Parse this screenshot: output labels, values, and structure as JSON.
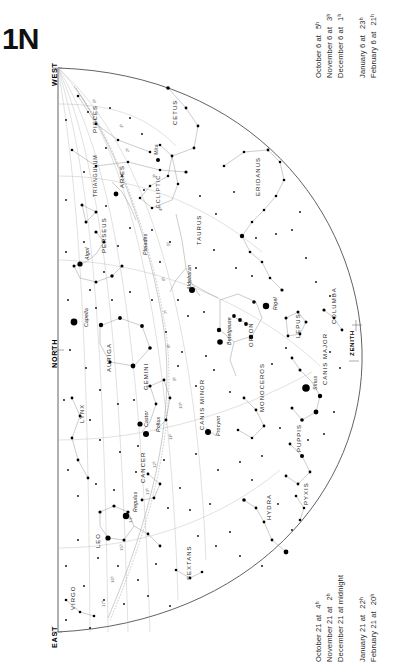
{
  "chart": {
    "number": "1N",
    "title_label": "1N",
    "cardinals": {
      "west": "WEST",
      "north": "NORTH",
      "east": "EAST"
    },
    "zenith_label": "ZENITH",
    "ecliptic_label": "ECLIPTIC"
  },
  "dates_top": {
    "heading": "",
    "rows": [
      {
        "date": "October 6 at",
        "time": "5ʰ"
      },
      {
        "date": "November 6 at",
        "time": "3ʰ"
      },
      {
        "date": "December 6 at",
        "time": "1ʰ"
      },
      {
        "date": "January 6 at",
        "time": "23ʰ"
      },
      {
        "date": "February 6 at",
        "time": "21ʰ"
      }
    ]
  },
  "dates_bottom": {
    "rows": [
      {
        "date": "October 21 at",
        "time": "4ʰ"
      },
      {
        "date": "November 21 at",
        "time": "2ʰ"
      },
      {
        "date": "December 21 at midnight",
        "time": ""
      },
      {
        "date": "January 21 at",
        "time": "22ʰ"
      },
      {
        "date": "February 21 at",
        "time": "20ʰ"
      }
    ]
  },
  "constellations": [
    {
      "name": "PISCES",
      "x": 92,
      "y": 133,
      "size": "normal"
    },
    {
      "name": "CETUS",
      "x": 172,
      "y": 125,
      "size": "normal"
    },
    {
      "name": "TRIANGULUM",
      "x": 92,
      "y": 197,
      "size": "small"
    },
    {
      "name": "ARIES",
      "x": 119,
      "y": 188,
      "size": "normal"
    },
    {
      "name": "ERIDANUS",
      "x": 255,
      "y": 196,
      "size": "normal"
    },
    {
      "name": "PERSEUS",
      "x": 101,
      "y": 253,
      "size": "normal"
    },
    {
      "name": "TAURUS",
      "x": 196,
      "y": 245,
      "size": "normal"
    },
    {
      "name": "AURIGA",
      "x": 106,
      "y": 372,
      "size": "normal"
    },
    {
      "name": "GEMINI",
      "x": 143,
      "y": 390,
      "size": "normal"
    },
    {
      "name": "ORION",
      "x": 248,
      "y": 347,
      "size": "normal"
    },
    {
      "name": "LEPUS",
      "x": 295,
      "y": 338,
      "size": "normal"
    },
    {
      "name": "COLUMBA",
      "x": 331,
      "y": 324,
      "size": "normal"
    },
    {
      "name": "CANIS MAJOR",
      "x": 322,
      "y": 385,
      "size": "normal"
    },
    {
      "name": "MONOCEROS",
      "x": 259,
      "y": 412,
      "size": "normal"
    },
    {
      "name": "CANIS MINOR",
      "x": 199,
      "y": 430,
      "size": "normal"
    },
    {
      "name": "LYNX",
      "x": 79,
      "y": 423,
      "size": "normal"
    },
    {
      "name": "PUPPIS",
      "x": 296,
      "y": 452,
      "size": "normal"
    },
    {
      "name": "CANCER",
      "x": 140,
      "y": 483,
      "size": "normal"
    },
    {
      "name": "PYXIS",
      "x": 303,
      "y": 505,
      "size": "normal"
    },
    {
      "name": "HYDRA",
      "x": 266,
      "y": 520,
      "size": "normal"
    },
    {
      "name": "LEO",
      "x": 95,
      "y": 548,
      "size": "normal"
    },
    {
      "name": "SEXTANS",
      "x": 186,
      "y": 580,
      "size": "normal"
    },
    {
      "name": "VIRGO",
      "x": 70,
      "y": 610,
      "size": "normal"
    }
  ],
  "named_stars": [
    {
      "name": "Mira",
      "x": 153,
      "y": 155
    },
    {
      "name": "Algol",
      "x": 84,
      "y": 260
    },
    {
      "name": "Pleiades",
      "x": 142,
      "y": 255
    },
    {
      "name": "Aldebaran",
      "x": 186,
      "y": 290
    },
    {
      "name": "Capella",
      "x": 83,
      "y": 327
    },
    {
      "name": "Rigel",
      "x": 272,
      "y": 310
    },
    {
      "name": "Betelgeuse",
      "x": 226,
      "y": 345
    },
    {
      "name": "Sirius",
      "x": 312,
      "y": 390
    },
    {
      "name": "Castor",
      "x": 143,
      "y": 427
    },
    {
      "name": "Pollux",
      "x": 155,
      "y": 432
    },
    {
      "name": "Procyon",
      "x": 215,
      "y": 436
    },
    {
      "name": "Regulus",
      "x": 132,
      "y": 512
    }
  ],
  "hour_ticks": [
    {
      "label": "0ʰ",
      "x": 92,
      "y": 103
    },
    {
      "label": "1ʰ",
      "x": 119,
      "y": 128
    },
    {
      "label": "2ʰ",
      "x": 125,
      "y": 152
    },
    {
      "label": "3ʰ",
      "x": 152,
      "y": 178
    },
    {
      "label": "4ʰ",
      "x": 158,
      "y": 211
    },
    {
      "label": "5ʰ",
      "x": 166,
      "y": 246
    },
    {
      "label": "6ʰ",
      "x": 161,
      "y": 281
    },
    {
      "label": "7ʰ",
      "x": 163,
      "y": 314
    },
    {
      "label": "8ʰ",
      "x": 166,
      "y": 348
    },
    {
      "label": "9ʰ",
      "x": 172,
      "y": 381
    },
    {
      "label": "10ʰ",
      "x": 178,
      "y": 409
    },
    {
      "label": "11ʰ",
      "x": 168,
      "y": 440
    },
    {
      "label": "12ʰ",
      "x": 152,
      "y": 468
    },
    {
      "label": "13ʰ",
      "x": 145,
      "y": 495
    },
    {
      "label": "14ʰ",
      "x": 128,
      "y": 523
    },
    {
      "label": "15ʰ",
      "x": 119,
      "y": 551
    },
    {
      "label": "16ʰ",
      "x": 110,
      "y": 583
    },
    {
      "label": "17ʰ",
      "x": 101,
      "y": 607
    }
  ],
  "chart_data": {
    "type": "scatter",
    "title": "1N",
    "xlabel": "",
    "ylabel": "",
    "projection": "half-dome sky chart, horizon semicircle, north at left center",
    "grid": true,
    "legend": "none",
    "horizon_cardinals": [
      "WEST",
      "NORTH",
      "EAST"
    ],
    "zenith_marked": true,
    "ecliptic_drawn": true,
    "hour_circles": [
      "0ʰ",
      "1ʰ",
      "2ʰ",
      "3ʰ",
      "4ʰ",
      "5ʰ",
      "6ʰ",
      "7ʰ",
      "8ʰ",
      "9ʰ",
      "10ʰ",
      "11ʰ",
      "12ʰ",
      "13ʰ",
      "14ʰ",
      "15ʰ",
      "16ʰ",
      "17ʰ"
    ],
    "constellation_count": 23,
    "named_star_count": 12,
    "epoch_rows_top": [
      "October 6 at 5ʰ",
      "November 6 at 3ʰ",
      "December 6 at 1ʰ",
      "January 6 at 23ʰ",
      "February 6 at 21ʰ"
    ],
    "epoch_rows_bottom": [
      "October 21 at 4ʰ",
      "November 21 at 2ʰ",
      "December 21 at midnight",
      "January 21 at 22ʰ",
      "February 21 at 20ʰ"
    ]
  }
}
